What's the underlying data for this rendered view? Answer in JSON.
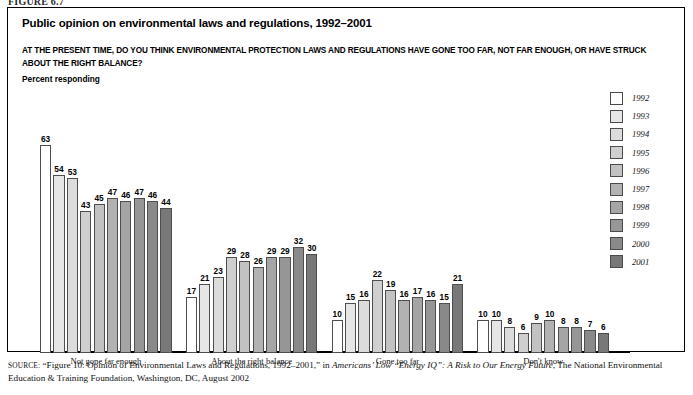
{
  "figure": {
    "label": "FIGURE 6.7"
  },
  "header": {
    "title": "Public opinion on environmental laws and regulations, 1992–2001",
    "question": "AT THE PRESENT TIME, DO YOU THINK ENVIRONMENTAL PROTECTION LAWS AND REGULATIONS HAVE GONE TOO FAR, NOT FAR ENOUGH, OR HAVE STRUCK ABOUT THE RIGHT BALANCE?",
    "axis_note": "Percent responding"
  },
  "legend": {
    "items": [
      {
        "label": "1992",
        "color": "#ffffff"
      },
      {
        "label": "1993",
        "color": "#e6e6e6"
      },
      {
        "label": "1994",
        "color": "#dcdcdc"
      },
      {
        "label": "1995",
        "color": "#cfcfcf"
      },
      {
        "label": "1996",
        "color": "#c2c2c2"
      },
      {
        "label": "1997",
        "color": "#b2b2b2"
      },
      {
        "label": "1998",
        "color": "#a5a5a5"
      },
      {
        "label": "1999",
        "color": "#969696"
      },
      {
        "label": "2000",
        "color": "#898989"
      },
      {
        "label": "2001",
        "color": "#787878"
      }
    ]
  },
  "source": {
    "keyword": "SOURCE:",
    "part1": " “Figure 10: Opinion of Environmental Laws and Regulations, 1992–2001,” in ",
    "italic1": "Americans’ Low “Energy IQ”: A Risk to Our Energy Future",
    "part2": ", The National Environmental Education & Training Foundation, Washington, DC, August 2002"
  },
  "chart_data": {
    "type": "bar",
    "title": "Public opinion on environmental laws and regulations, 1992–2001",
    "subtitle": "AT THE PRESENT TIME, DO YOU THINK ENVIRONMENTAL PROTECTION LAWS AND REGULATIONS HAVE GONE TOO FAR, NOT FAR ENOUGH, OR HAVE STRUCK ABOUT THE RIGHT BALANCE?",
    "xlabel": "",
    "ylabel": "Percent responding",
    "ylim": [
      0,
      70
    ],
    "grid": false,
    "legend_position": "right",
    "categories": [
      "Not  gone far enough",
      "About the right balance",
      "Gone too far",
      "Don't know"
    ],
    "series": [
      {
        "name": "1992",
        "color": "#ffffff",
        "values": [
          63,
          17,
          10,
          10
        ]
      },
      {
        "name": "1993",
        "color": "#e6e6e6",
        "values": [
          54,
          21,
          15,
          10
        ]
      },
      {
        "name": "1994",
        "color": "#dcdcdc",
        "values": [
          53,
          23,
          16,
          8
        ]
      },
      {
        "name": "1995",
        "color": "#cfcfcf",
        "values": [
          43,
          29,
          22,
          6
        ]
      },
      {
        "name": "1996",
        "color": "#c2c2c2",
        "values": [
          45,
          28,
          19,
          9
        ]
      },
      {
        "name": "1997",
        "color": "#b2b2b2",
        "values": [
          47,
          26,
          16,
          10
        ]
      },
      {
        "name": "1998",
        "color": "#a5a5a5",
        "values": [
          46,
          29,
          17,
          8
        ]
      },
      {
        "name": "1999",
        "color": "#969696",
        "values": [
          47,
          29,
          16,
          8
        ]
      },
      {
        "name": "2000",
        "color": "#898989",
        "values": [
          46,
          32,
          15,
          7
        ]
      },
      {
        "name": "2001",
        "color": "#787878",
        "values": [
          44,
          30,
          21,
          6
        ]
      }
    ]
  }
}
